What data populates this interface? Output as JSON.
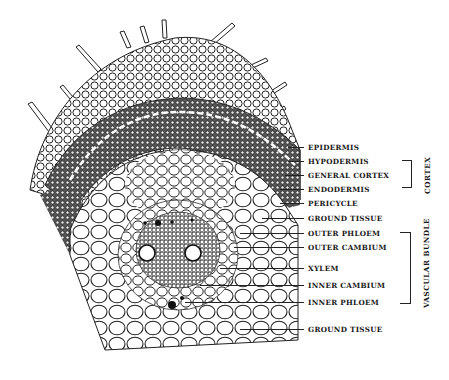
{
  "figure": {
    "type": "botanical cross-section illustration"
  },
  "labels": [
    {
      "id": "epidermis",
      "text": "EPIDERMIS",
      "y": 143
    },
    {
      "id": "hypodermis",
      "text": "HYPODERMIS",
      "y": 157
    },
    {
      "id": "general-cortex",
      "text": "GENERAL  CORTEX",
      "y": 171
    },
    {
      "id": "endodermis",
      "text": "ENDODERMIS",
      "y": 185
    },
    {
      "id": "pericycle",
      "text": "PERICYCLE",
      "y": 199
    },
    {
      "id": "ground-tissue-top",
      "text": "GROUND  TISSUE",
      "y": 214
    },
    {
      "id": "outer-phloem",
      "text": "OUTER  PHLOEM",
      "y": 229
    },
    {
      "id": "outer-cambium",
      "text": "OUTER  CAMBIUM",
      "y": 243
    },
    {
      "id": "xylem",
      "text": "XYLEM",
      "y": 264
    },
    {
      "id": "inner-cambium",
      "text": "INNER  CAMBIUM",
      "y": 281
    },
    {
      "id": "inner-phloem",
      "text": "INNER  PHLOEM",
      "y": 298
    },
    {
      "id": "ground-tissue-bottom",
      "text": "GROUND  TISSUE",
      "y": 325
    }
  ],
  "groups": [
    {
      "id": "cortex",
      "text": "CORTEX",
      "from": "hypodermis",
      "to": "endodermis"
    },
    {
      "id": "vascular-bundle",
      "text": "VASCULAR  BUNDLE",
      "from": "outer-phloem",
      "to": "inner-phloem"
    }
  ],
  "colors": {
    "ink": "#1a1a1a",
    "background": "#ffffff"
  }
}
